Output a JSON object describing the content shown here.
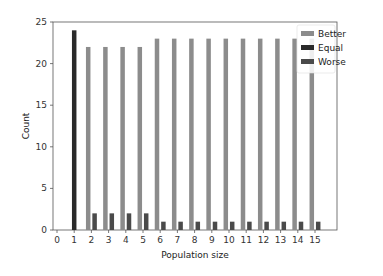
{
  "chart_data": {
    "type": "bar",
    "title": "",
    "xlabel": "Population size",
    "ylabel": "Count",
    "ylim": [
      0,
      25
    ],
    "xlim": [
      0,
      15
    ],
    "yticks": [
      0,
      5,
      10,
      15,
      20,
      25
    ],
    "xticks": [
      0,
      1,
      2,
      3,
      4,
      5,
      6,
      7,
      8,
      9,
      10,
      11,
      12,
      13,
      14,
      15
    ],
    "grid": false,
    "legend_position": "upper right",
    "categories": [
      1,
      2,
      3,
      4,
      5,
      6,
      7,
      8,
      9,
      10,
      11,
      12,
      13,
      14,
      15
    ],
    "series": [
      {
        "name": "Better",
        "color": "#8c8c8c",
        "values": [
          0,
          22,
          22,
          22,
          22,
          23,
          23,
          23,
          23,
          23,
          23,
          23,
          23,
          23,
          23
        ]
      },
      {
        "name": "Equal",
        "color": "#2a2a2a",
        "values": [
          24,
          0,
          0,
          0,
          0,
          0,
          0,
          0,
          0,
          0,
          0,
          0,
          0,
          0,
          0
        ]
      },
      {
        "name": "Worse",
        "color": "#4a4a4a",
        "values": [
          0,
          2,
          2,
          2,
          2,
          1,
          1,
          1,
          1,
          1,
          1,
          1,
          1,
          1,
          1
        ]
      }
    ]
  }
}
